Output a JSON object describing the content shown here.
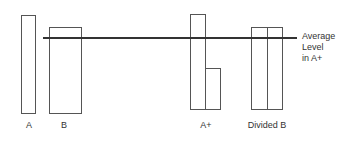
{
  "diagram": {
    "bars": [
      {
        "id": "A",
        "label": "A"
      },
      {
        "id": "B",
        "label": "B"
      },
      {
        "id": "A_plus",
        "label": "A+"
      },
      {
        "id": "divided_B",
        "label": "Divided B"
      }
    ],
    "reference_line": {
      "label_line1": "Average",
      "label_line2": "Level",
      "label_line3": "in A+"
    }
  },
  "colors": {
    "stroke": "#555555",
    "line": "#333333",
    "background": "#ffffff"
  }
}
